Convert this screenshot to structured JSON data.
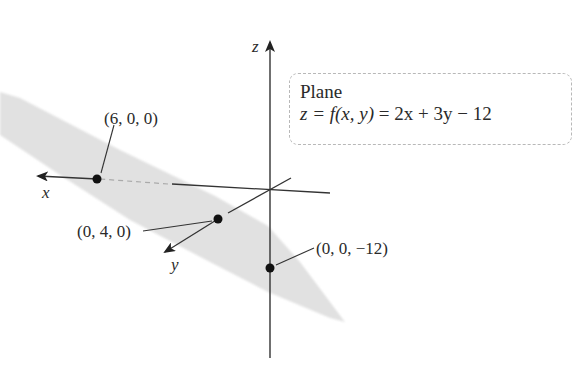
{
  "figure": {
    "axes": {
      "x_label": "x",
      "y_label": "y",
      "z_label": "z"
    },
    "equation_box": {
      "title": "Plane",
      "equation_lhs": "z = f(x, y)",
      "equation_rhs": "= 2x + 3y − 12",
      "equation_full": "z = f(x, y) = 2x + 3y − 12"
    },
    "points": [
      {
        "label": "(6, 0, 0)",
        "coords": [
          6,
          0,
          0
        ],
        "axis": "x-intercept"
      },
      {
        "label": "(0, 4, 0)",
        "coords": [
          0,
          4,
          0
        ],
        "axis": "y-intercept"
      },
      {
        "label": "(0, 0, −12)",
        "coords": [
          0,
          0,
          -12
        ],
        "axis": "z-intercept"
      }
    ],
    "colors": {
      "plane_fill": "#dcdcdc",
      "axis_line": "#333333",
      "point": "#111111",
      "box_border": "#b8b8b8"
    }
  }
}
